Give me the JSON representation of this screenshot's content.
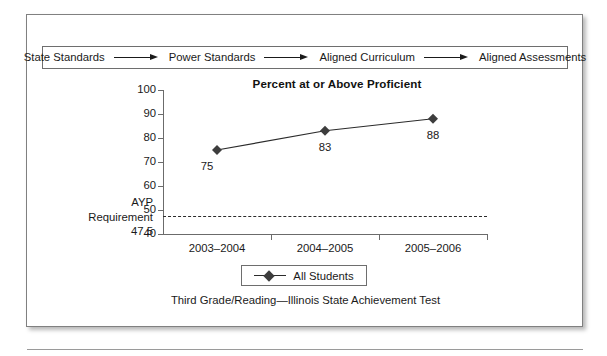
{
  "flow": {
    "steps": [
      "State Standards",
      "Power Standards",
      "Aligned Curriculum",
      "Aligned Assessments"
    ],
    "arrow_icon": "right-arrow-icon"
  },
  "chart_data": {
    "type": "line",
    "title": "Percent at or Above Proficient",
    "caption": "Third Grade/Reading—Illinois State Achievement Test",
    "categories": [
      "2003–2004",
      "2004–2005",
      "2005–2006"
    ],
    "series": [
      {
        "name": "All Students",
        "values": [
          75,
          83,
          88
        ]
      }
    ],
    "point_labels": [
      "75",
      "83",
      "88"
    ],
    "ylim": [
      40,
      100
    ],
    "yticks": [
      40,
      50,
      60,
      70,
      80,
      90,
      100
    ],
    "ytick_labels": [
      "40",
      "50",
      "60",
      "70",
      "80",
      "90",
      "100"
    ],
    "xlabel": "",
    "ylabel": "",
    "grid": false,
    "legend": {
      "position": "bottom-center",
      "entries": [
        "All Students"
      ]
    },
    "threshold": {
      "name": "AYP Requirement",
      "value": 47.5,
      "value_text": "47.5",
      "label_lines": [
        "AYP",
        "Requirement",
        "47.5"
      ],
      "style": "dashed"
    },
    "colors": {
      "marker": "#3d3d3d",
      "line": "#2b2b2b",
      "axis": "#6b6b6b",
      "threshold": "#2b2b2b",
      "text": "#1a1a1a"
    }
  }
}
